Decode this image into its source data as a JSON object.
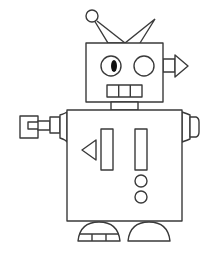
{
  "colors": {
    "stroke": "#3a3a3a",
    "fill": "#ffffff",
    "pupil": "#111111"
  },
  "parts": {
    "antenna": [
      "antenna-ball",
      "antenna-spike"
    ],
    "head": {
      "eyes": 2,
      "mouth_segments": 3,
      "ear": "arrow-right"
    },
    "body": {
      "panel": [
        "triangle",
        "bar",
        "bar",
        "circle",
        "circle"
      ]
    },
    "arms": [
      "claw-left",
      "stub-right"
    ],
    "feet": 2
  }
}
